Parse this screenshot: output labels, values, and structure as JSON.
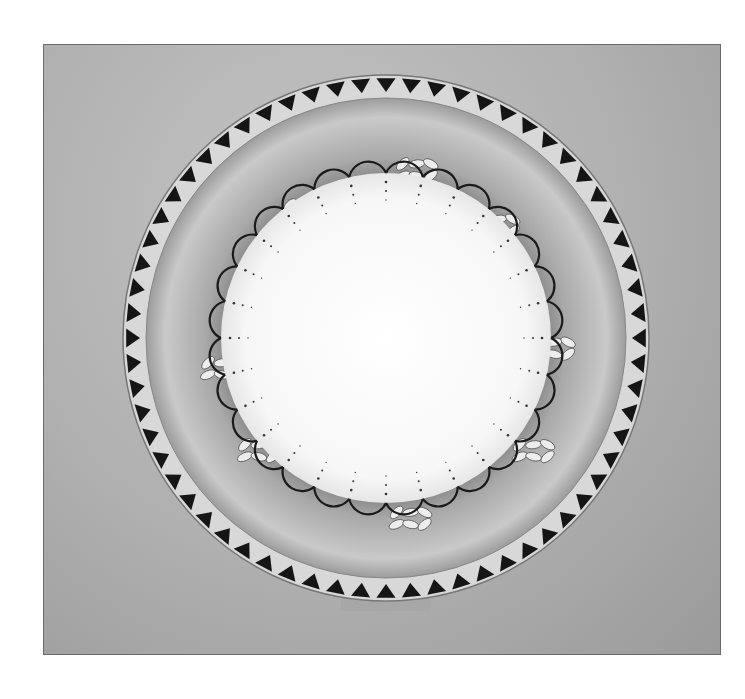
{
  "image": {
    "subject": "decorative porcelain plate",
    "colors": {
      "page_bg": "#ffffff",
      "backdrop": "#b4b4b4",
      "rim_band": "#d8d8d8",
      "rim_triangle": "#151515",
      "well_outer": "#8c8c8c",
      "center": "#fafafa",
      "scallop_line": "#1a1a1a"
    },
    "plate": {
      "cx": 342,
      "cy": 293,
      "outer_radius": 263,
      "inner_rim_radius": 240,
      "center_radius": 165,
      "rim_triangles": 64,
      "scallops": 28
    }
  }
}
